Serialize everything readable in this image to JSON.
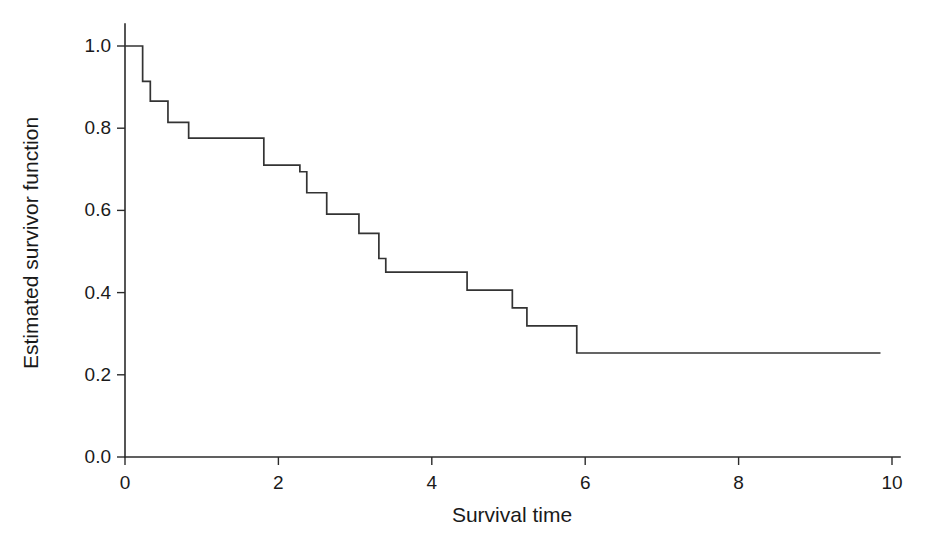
{
  "chart_data": {
    "type": "line",
    "subtype": "step-post",
    "title": "",
    "xlabel": "Survival time",
    "ylabel": "Estimated survivor function",
    "xlim": [
      0,
      10
    ],
    "ylim": [
      0.0,
      1.0
    ],
    "xticks": [
      0,
      2,
      4,
      6,
      8,
      10
    ],
    "xticklabels": [
      "0",
      "2",
      "4",
      "6",
      "8",
      "10"
    ],
    "yticks": [
      0.0,
      0.2,
      0.4,
      0.6,
      0.8,
      1.0
    ],
    "yticklabels": [
      "0.0",
      "0.2",
      "0.4",
      "0.6",
      "0.8",
      "1.0"
    ],
    "grid": false,
    "legend": null,
    "line_color": "#333333",
    "series": [
      {
        "name": "Estimated survivor function",
        "x": [
          0.0,
          0.23,
          0.33,
          0.56,
          0.83,
          1.81,
          2.28,
          2.37,
          2.63,
          3.05,
          3.31,
          3.4,
          4.46,
          5.05,
          5.24,
          5.89,
          9.85
        ],
        "y": [
          1.0,
          0.914,
          0.866,
          0.814,
          0.776,
          0.71,
          0.694,
          0.643,
          0.591,
          0.544,
          0.483,
          0.45,
          0.406,
          0.363,
          0.319,
          0.253,
          0.253
        ]
      }
    ]
  },
  "axes": {
    "y_axis_label": "Estimated survivor function",
    "x_axis_label": "Survival time"
  },
  "geometry": {
    "x0_px": 125,
    "x10_px": 892,
    "y0_px": 457,
    "y1_px": 46,
    "y_axis_top_px": 24,
    "x_axis_right_px": 900
  }
}
